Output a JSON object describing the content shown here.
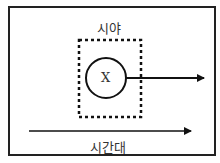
{
  "diagram": {
    "top_label": "시야",
    "center_label": "X",
    "bottom_label": "시간대",
    "colors": {
      "stroke": "#111111",
      "background": "#ffffff"
    }
  }
}
